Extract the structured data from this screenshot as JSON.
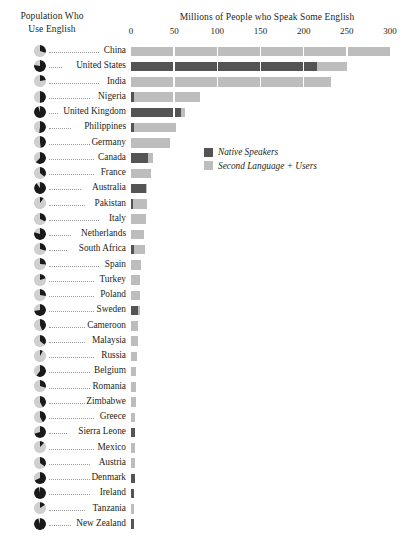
{
  "left_header": "Population Who Use English",
  "left_header_line1": "Population Who",
  "left_header_line2": "Use English",
  "axis_title": "Millions of People who Speak Some English",
  "legend": {
    "native_label": "Native Speakers",
    "second_label": "Second Language + Users",
    "native_color": "#545454",
    "second_color": "#bdbdbd"
  },
  "chart_data": {
    "type": "bar",
    "orientation": "horizontal",
    "stacked": true,
    "title": "Millions of People who Speak Some English",
    "xlabel": "Millions of People who Speak Some English",
    "ylabel": "",
    "xlim": [
      0,
      300
    ],
    "xticks": [
      0,
      50,
      100,
      150,
      200,
      250,
      300
    ],
    "grid": false,
    "legend_position": "inside-upper-right",
    "secondary_series": {
      "name": "Population Who Use English",
      "type": "pie-glyph",
      "description": "Pie icon per country showing fraction of national population that uses English (dark wedge = share using English)"
    },
    "categories": [
      "China",
      "United States",
      "India",
      "Nigeria",
      "United Kingdom",
      "Philippines",
      "Germany",
      "Canada",
      "France",
      "Australia",
      "Pakistan",
      "Italy",
      "Netherlands",
      "South Africa",
      "Spain",
      "Turkey",
      "Poland",
      "Sweden",
      "Cameroon",
      "Malaysia",
      "Russia",
      "Belgium",
      "Romania",
      "Zimbabwe",
      "Greece",
      "Sierra Leone",
      "Mexico",
      "Austria",
      "Denmark",
      "Ireland",
      "Tanzania",
      "New Zealand"
    ],
    "series": [
      {
        "name": "Native Speakers",
        "color": "#545454",
        "values": [
          0,
          215,
          0,
          4,
          58,
          4,
          0,
          20,
          0,
          17,
          2,
          0,
          0,
          4,
          0,
          0,
          0,
          8,
          0,
          0,
          0,
          0,
          0,
          0,
          0,
          5,
          0,
          0,
          5,
          4,
          0,
          4
        ]
      },
      {
        "name": "Second Language + Users",
        "color": "#bdbdbd",
        "values": [
          300,
          35,
          232,
          76,
          5,
          48,
          45,
          5,
          23,
          2,
          17,
          17,
          15,
          12,
          12,
          11,
          11,
          1,
          8,
          8,
          7,
          6,
          6,
          6,
          5,
          0,
          5,
          5,
          0,
          0,
          4,
          0
        ]
      }
    ],
    "totals": [
      300,
      250,
      232,
      80,
      63,
      52,
      45,
      25,
      23,
      19,
      19,
      17,
      15,
      16,
      12,
      11,
      11,
      9,
      8,
      8,
      7,
      6,
      6,
      6,
      5,
      5,
      5,
      5,
      5,
      4,
      4,
      4
    ],
    "pie_fractions": [
      0.3,
      0.78,
      0.22,
      0.5,
      0.95,
      0.52,
      0.48,
      0.62,
      0.36,
      0.9,
      0.1,
      0.32,
      0.8,
      0.3,
      0.26,
      0.2,
      0.28,
      0.72,
      0.44,
      0.36,
      0.08,
      0.6,
      0.3,
      0.42,
      0.42,
      0.7,
      0.12,
      0.35,
      0.68,
      0.97,
      0.16,
      0.95
    ]
  }
}
